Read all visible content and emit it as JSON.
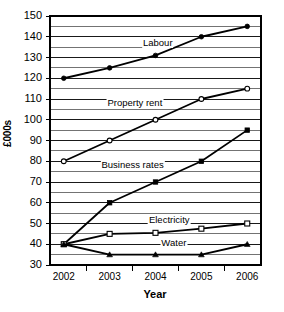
{
  "chart_data": {
    "type": "line",
    "title": "",
    "xlabel": "Year",
    "ylabel": "£000s",
    "categories": [
      "2002",
      "2003",
      "2004",
      "2005",
      "2006"
    ],
    "x": [
      2002,
      2003,
      2004,
      2005,
      2006
    ],
    "xlim": [
      2001.7,
      2006.3
    ],
    "ylim": [
      30,
      150
    ],
    "ytick_labels": [
      "30",
      "40",
      "50",
      "60",
      "70",
      "80",
      "90",
      "100",
      "110",
      "120",
      "130",
      "140",
      "150"
    ],
    "yticks": [
      30,
      40,
      50,
      60,
      70,
      80,
      90,
      100,
      110,
      120,
      130,
      140,
      150
    ],
    "minor_gridline_step": 5,
    "grid": true,
    "legend": "inline-labels",
    "series": [
      {
        "name": "Labour",
        "marker": "filled-circle",
        "values": [
          120,
          125,
          131,
          140,
          145
        ],
        "label_x": 2004.05,
        "label_y": 137
      },
      {
        "name": "Property rent",
        "marker": "open-circle",
        "values": [
          80,
          90,
          100,
          110,
          115
        ],
        "label_x": 2003.55,
        "label_y": 108
      },
      {
        "name": "Business rates",
        "marker": "filled-square",
        "values": [
          40,
          60,
          70,
          80,
          95
        ],
        "label_x": 2003.5,
        "label_y": 78
      },
      {
        "name": "Electricity",
        "marker": "open-square",
        "values": [
          40,
          45,
          45.5,
          47.5,
          50
        ],
        "label_x": 2004.3,
        "label_y": 51.5
      },
      {
        "name": "Water",
        "marker": "filled-triangle",
        "values": [
          40,
          35,
          35,
          35,
          40
        ],
        "label_x": 2004.4,
        "label_y": 40.5
      }
    ]
  },
  "axes": {
    "x_title": "Year",
    "y_title": "£000s"
  }
}
